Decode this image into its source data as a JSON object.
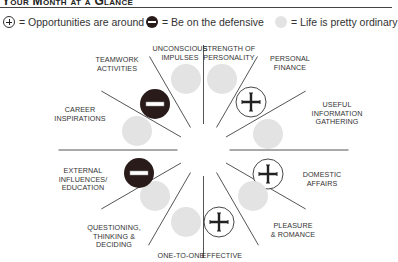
{
  "header": {
    "title": "Your Month at a Glance"
  },
  "legend": [
    {
      "icon": "plus-circle-icon",
      "text": "= Opportunities are around"
    },
    {
      "icon": "minus-circle-icon",
      "text": "= Be on the defensive"
    },
    {
      "icon": "gray-circle-icon",
      "text": "= Life is pretty ordinary"
    }
  ],
  "sectors": [
    {
      "label_lines": [
        "UNCONSCIOUS",
        "IMPULSES"
      ],
      "status": "ordinary"
    },
    {
      "label_lines": [
        "STRENGTH OF",
        "PERSONALITY"
      ],
      "status": "ordinary"
    },
    {
      "label_lines": [
        "PERSONAL",
        "FINANCE"
      ],
      "status": "opportunity"
    },
    {
      "label_lines": [
        "USEFUL",
        "INFORMATION",
        "GATHERING"
      ],
      "status": "ordinary"
    },
    {
      "label_lines": [
        "DOMESTIC",
        "AFFAIRS"
      ],
      "status": "opportunity"
    },
    {
      "label_lines": [
        "PLEASURE",
        "& ROMANCE"
      ],
      "status": "ordinary"
    },
    {
      "label_lines": [
        "EFFECTIVE"
      ],
      "status": "opportunity"
    },
    {
      "label_lines": [
        "ONE-TO-ONE"
      ],
      "status": "ordinary"
    },
    {
      "label_lines": [
        "QUESTIONING,",
        "THINKING &",
        "DECIDING"
      ],
      "status": "ordinary"
    },
    {
      "label_lines": [
        "EXTERNAL",
        "INFLUENCES/",
        "EDUCATION"
      ],
      "status": "defensive"
    },
    {
      "label_lines": [
        "CAREER",
        "INSPIRATIONS"
      ],
      "status": "ordinary"
    },
    {
      "label_lines": [
        "TEAMWORK",
        "ACTIVITIES"
      ],
      "status": "defensive"
    }
  ],
  "colors": {
    "ordinary": "#e3e3e3",
    "defensive": "#2a1b1b",
    "line": "#555555"
  }
}
